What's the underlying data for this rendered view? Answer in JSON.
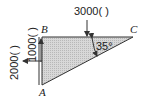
{
  "diagram": {
    "points": {
      "A": "A",
      "B": "B",
      "C": "C"
    },
    "forces": {
      "top": "3000(   )",
      "vertical": "1000(   )",
      "horizontal": "2000(   )"
    },
    "angle": "35°"
  }
}
